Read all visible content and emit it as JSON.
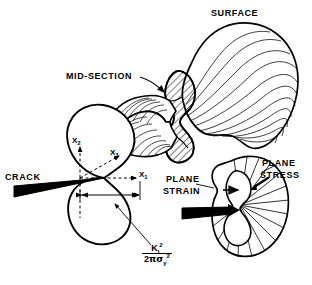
{
  "figure": {
    "title_visible": false,
    "background_color": "#ffffff",
    "ink_color": "#000000"
  },
  "labels": {
    "surface": "SURFACE",
    "mid_section": "MID-SECTION",
    "crack_tip_line1": "CRACK",
    "crack_tip_line2": "TIP",
    "plane_strain_line1": "PLANE",
    "plane_strain_line2": "STRAIN",
    "plane_stress_line1": "PLANE",
    "plane_stress_line2": "STRESS"
  },
  "axes": {
    "x1": "X",
    "x1_sub": "1",
    "x2": "X",
    "x2_sub": "2",
    "x3": "X",
    "x3_sub": "3"
  },
  "formula": {
    "numerator_base": "K",
    "numerator_sub": "I",
    "numerator_sup": "2",
    "denominator_coefficient": "2",
    "denominator_pi": "π",
    "denominator_sigma": "σ",
    "denominator_sigma_sub": "y",
    "denominator_sigma_sup": "2",
    "plain_text": "K_I^2 / (2π σ_y^2)"
  },
  "annotations": {
    "dimension_arrow": "plastic zone size dimension",
    "crack_wedge_left": "black crack wedge at crack tip",
    "crack_wedge_right": "black crack wedge entering plane stress zone",
    "mid_section_arrow": "leader arrow to hatched mid-section",
    "plane_strain_arrow": "leader arrow to inner plane strain lobe",
    "plane_stress_arrow": "leader arrow to outer plane stress boundary"
  }
}
